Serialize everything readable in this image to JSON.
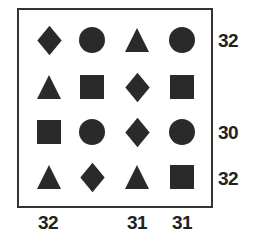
{
  "diagram": {
    "type": "shape-grid-puzzle",
    "rows": 4,
    "cols": 4,
    "colors": {
      "shape_fill": "#2a2a2a",
      "border": "#333333",
      "label": "#222222",
      "background": "#ffffff"
    },
    "grid": [
      [
        "diamond",
        "circle",
        "triangle",
        "circle"
      ],
      [
        "triangle",
        "square",
        "diamond",
        "square"
      ],
      [
        "square",
        "circle",
        "diamond",
        "circle"
      ],
      [
        "triangle",
        "diamond",
        "triangle",
        "square"
      ]
    ],
    "row_sums": [
      "32",
      "",
      "30",
      "32"
    ],
    "col_sums": [
      "32",
      "",
      "31",
      "31"
    ]
  }
}
